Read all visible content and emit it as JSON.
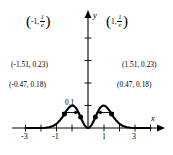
{
  "figure": {
    "kind": "cartesian-graph",
    "background": "#ffffff",
    "ink": "#000000"
  },
  "axes": {
    "x_label": "x",
    "y_label": "y",
    "x_ticks_labeled": [
      "-3",
      "-1",
      "1",
      "3"
    ],
    "x_tick_values": [
      -3,
      -1,
      1,
      3
    ],
    "x_ticks_unlabeled": [
      -3.5,
      -2.5,
      -2,
      -1.5,
      -0.5,
      0.5,
      1.5,
      2,
      2.5,
      3.5
    ],
    "y_axis_tick_label": "0.1"
  },
  "annotations": {
    "peak_left": {
      "open_paren": "(",
      "x_part": "-1,",
      "frac_num": "1",
      "frac_den": "e",
      "close_paren": ")"
    },
    "peak_right": {
      "open_paren": "(",
      "x_part": "1,",
      "frac_num": "1",
      "frac_den": "e",
      "close_paren": ")"
    },
    "point_outer_left": "(-1.51, 0.23)",
    "point_outer_right": "(1.51, 0.23)",
    "point_inner_left": "(-0.47, 0.18)",
    "point_inner_right": "(0.47, 0.18)"
  },
  "chart_data": {
    "type": "line",
    "title": "",
    "xlabel": "x",
    "ylabel": "y",
    "xlim": [
      -4.0,
      4.0
    ],
    "ylim": [
      -0.03,
      0.45
    ],
    "grid": false,
    "legend": false,
    "function": "y = x^2 * e^(-x^2)",
    "series": [
      {
        "name": "x^2 e^(-x^2)",
        "color": "#000000",
        "x": [
          -4.0,
          -3.75,
          -3.5,
          -3.25,
          -3.0,
          -2.75,
          -2.5,
          -2.25,
          -2.0,
          -1.9,
          -1.8,
          -1.7,
          -1.6,
          -1.51,
          -1.4,
          -1.3,
          -1.2,
          -1.1,
          -1.0,
          -0.9,
          -0.8,
          -0.7,
          -0.6,
          -0.47,
          -0.4,
          -0.3,
          -0.2,
          -0.1,
          0.0,
          0.1,
          0.2,
          0.3,
          0.4,
          0.47,
          0.6,
          0.7,
          0.8,
          0.9,
          1.0,
          1.1,
          1.2,
          1.3,
          1.4,
          1.51,
          1.6,
          1.7,
          1.8,
          1.9,
          2.0,
          2.25,
          2.5,
          2.75,
          3.0,
          3.25,
          3.5,
          3.75,
          4.0
        ],
        "y": [
          0.0,
          0.0,
          0.0001,
          0.0003,
          0.0011,
          0.0039,
          0.0123,
          0.0317,
          0.0733,
          0.099,
          0.1268,
          0.1586,
          0.1901,
          0.23,
          0.277,
          0.312,
          0.341,
          0.359,
          0.3679,
          0.3606,
          0.3373,
          0.3003,
          0.251,
          0.18,
          0.1364,
          0.0823,
          0.0384,
          0.0099,
          0.0,
          0.0099,
          0.0384,
          0.0823,
          0.1364,
          0.18,
          0.251,
          0.3003,
          0.3373,
          0.3606,
          0.3679,
          0.359,
          0.341,
          0.312,
          0.277,
          0.23,
          0.1901,
          0.1586,
          0.1268,
          0.099,
          0.0733,
          0.0317,
          0.0123,
          0.0039,
          0.0011,
          0.0003,
          0.0001,
          0.0,
          0.0
        ]
      }
    ],
    "marked_points": [
      {
        "label": "(-1.51, 0.23)",
        "x": -1.51,
        "y": 0.23
      },
      {
        "label": "(1.51, 0.23)",
        "x": 1.51,
        "y": 0.23
      },
      {
        "label": "(-0.47, 0.18)",
        "x": -0.47,
        "y": 0.18
      },
      {
        "label": "(0.47, 0.18)",
        "x": 0.47,
        "y": 0.18
      },
      {
        "label": "(-1, 1/e)",
        "x": -1.0,
        "y": 0.3679
      },
      {
        "label": "(1, 1/e)",
        "x": 1.0,
        "y": 0.3679
      }
    ]
  }
}
